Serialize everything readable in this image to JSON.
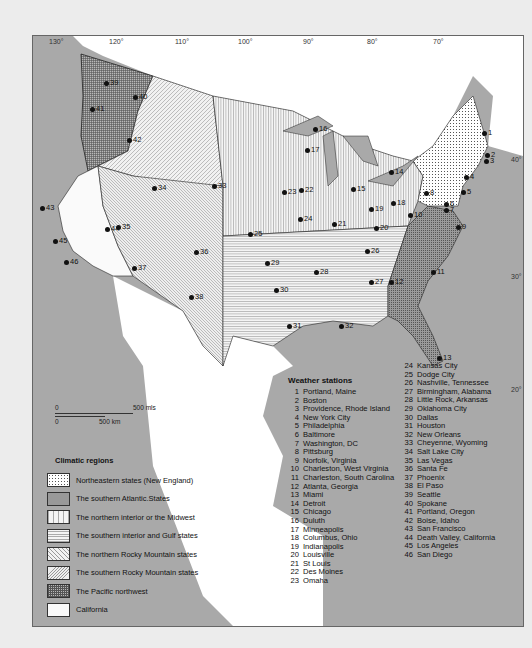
{
  "map": {
    "longitude_labels": [
      "130°",
      "120°",
      "110°",
      "100°",
      "90°",
      "80°",
      "70°"
    ],
    "latitude_labels": [
      "40°",
      "30°",
      "20°"
    ],
    "scale_bar": {
      "miles_start": "0",
      "miles_end": "500 mls",
      "km_start": "0",
      "km_end": "500 km"
    }
  },
  "colors": {
    "ocean": "#a9a9a9",
    "frame_border": "#666666",
    "text": "#111111",
    "outside_land": "#ffffff"
  },
  "stations_heading": "Weather stations",
  "stations": [
    {
      "n": "1",
      "name": "Portland, Maine"
    },
    {
      "n": "2",
      "name": "Boston"
    },
    {
      "n": "3",
      "name": "Providence, Rhode Island"
    },
    {
      "n": "4",
      "name": "New York City"
    },
    {
      "n": "5",
      "name": "Philadelphia"
    },
    {
      "n": "6",
      "name": "Baltimore"
    },
    {
      "n": "7",
      "name": "Washington, DC"
    },
    {
      "n": "8",
      "name": "Pittsburg"
    },
    {
      "n": "9",
      "name": "Norfolk, Virginia"
    },
    {
      "n": "10",
      "name": "Charleston, West Virginia"
    },
    {
      "n": "11",
      "name": "Charleston, South Carolina"
    },
    {
      "n": "12",
      "name": "Atlanta, Georgia"
    },
    {
      "n": "13",
      "name": "Miami"
    },
    {
      "n": "14",
      "name": "Detroit"
    },
    {
      "n": "15",
      "name": "Chicago"
    },
    {
      "n": "16",
      "name": "Duluth"
    },
    {
      "n": "17",
      "name": "Minneapolis"
    },
    {
      "n": "18",
      "name": "Columbus, Ohio"
    },
    {
      "n": "19",
      "name": "Indianapolis"
    },
    {
      "n": "20",
      "name": "Louisville"
    },
    {
      "n": "21",
      "name": "St Louis"
    },
    {
      "n": "22",
      "name": "Des Moines"
    },
    {
      "n": "23",
      "name": "Omaha"
    },
    {
      "n": "24",
      "name": "Kansas City"
    },
    {
      "n": "25",
      "name": "Dodge City"
    },
    {
      "n": "26",
      "name": "Nashville, Tennessee"
    },
    {
      "n": "27",
      "name": "Birmingham, Alabama"
    },
    {
      "n": "28",
      "name": "Little Rock, Arkansas"
    },
    {
      "n": "29",
      "name": "Oklahoma City"
    },
    {
      "n": "30",
      "name": "Dallas"
    },
    {
      "n": "31",
      "name": "Houston"
    },
    {
      "n": "32",
      "name": "New Orleans"
    },
    {
      "n": "33",
      "name": "Cheyenne, Wyoming"
    },
    {
      "n": "34",
      "name": "Salt Lake City"
    },
    {
      "n": "35",
      "name": "Las Vegas"
    },
    {
      "n": "36",
      "name": "Santa Fe"
    },
    {
      "n": "37",
      "name": "Phoenix"
    },
    {
      "n": "38",
      "name": "El Paso"
    },
    {
      "n": "39",
      "name": "Seattle"
    },
    {
      "n": "40",
      "name": "Spokane"
    },
    {
      "n": "41",
      "name": "Portland, Oregon"
    },
    {
      "n": "42",
      "name": "Boise, Idaho"
    },
    {
      "n": "43",
      "name": "San Francisco"
    },
    {
      "n": "44",
      "name": "Death Valley, California"
    },
    {
      "n": "45",
      "name": "Los Angeles"
    },
    {
      "n": "46",
      "name": "San Diego"
    }
  ],
  "legend": {
    "title": "Climatic regions",
    "items": [
      {
        "label": "Northeastern states (New England)",
        "pattern": "dots"
      },
      {
        "label": "The southern Atlantic.States",
        "pattern": "dense-dots"
      },
      {
        "label": "The northern interior or the Midwest",
        "pattern": "vertical-lines"
      },
      {
        "label": "The southern interior and Gulf states",
        "pattern": "horizontal-lines"
      },
      {
        "label": "The northern Rocky Mountain states",
        "pattern": "diagonal-lines"
      },
      {
        "label": "The southern Rocky Mountain states",
        "pattern": "diagonal-lines-dense"
      },
      {
        "label": "The Pacific northwest",
        "pattern": "crosshatch"
      },
      {
        "label": "California",
        "pattern": "blank"
      }
    ]
  },
  "map_markers": [
    {
      "n": "1",
      "x": 448,
      "y": 93
    },
    {
      "n": "2",
      "x": 451,
      "y": 115
    },
    {
      "n": "3",
      "x": 450,
      "y": 121
    },
    {
      "n": "4",
      "x": 430,
      "y": 137
    },
    {
      "n": "5",
      "x": 427,
      "y": 152
    },
    {
      "n": "6",
      "x": 410,
      "y": 164
    },
    {
      "n": "7",
      "x": 410,
      "y": 170
    },
    {
      "n": "8",
      "x": 390,
      "y": 153
    },
    {
      "n": "9",
      "x": 422,
      "y": 187
    },
    {
      "n": "10",
      "x": 374,
      "y": 175
    },
    {
      "n": "11",
      "x": 397,
      "y": 232
    },
    {
      "n": "12",
      "x": 355,
      "y": 242
    },
    {
      "n": "13",
      "x": 403,
      "y": 318
    },
    {
      "n": "14",
      "x": 355,
      "y": 132
    },
    {
      "n": "15",
      "x": 317,
      "y": 149
    },
    {
      "n": "16",
      "x": 279,
      "y": 89
    },
    {
      "n": "17",
      "x": 271,
      "y": 110
    },
    {
      "n": "18",
      "x": 357,
      "y": 163
    },
    {
      "n": "19",
      "x": 335,
      "y": 169
    },
    {
      "n": "20",
      "x": 340,
      "y": 188
    },
    {
      "n": "21",
      "x": 298,
      "y": 184
    },
    {
      "n": "22",
      "x": 265,
      "y": 150
    },
    {
      "n": "23",
      "x": 248,
      "y": 152
    },
    {
      "n": "24",
      "x": 264,
      "y": 179
    },
    {
      "n": "25",
      "x": 214,
      "y": 194
    },
    {
      "n": "26",
      "x": 331,
      "y": 211
    },
    {
      "n": "27",
      "x": 335,
      "y": 242
    },
    {
      "n": "28",
      "x": 280,
      "y": 232
    },
    {
      "n": "29",
      "x": 231,
      "y": 223
    },
    {
      "n": "30",
      "x": 240,
      "y": 250
    },
    {
      "n": "31",
      "x": 253,
      "y": 286
    },
    {
      "n": "32",
      "x": 305,
      "y": 286
    },
    {
      "n": "33",
      "x": 178,
      "y": 146
    },
    {
      "n": "34",
      "x": 118,
      "y": 148
    },
    {
      "n": "35",
      "x": 82,
      "y": 187
    },
    {
      "n": "36",
      "x": 160,
      "y": 212
    },
    {
      "n": "37",
      "x": 98,
      "y": 228
    },
    {
      "n": "38",
      "x": 155,
      "y": 257
    },
    {
      "n": "39",
      "x": 70,
      "y": 43
    },
    {
      "n": "40",
      "x": 99,
      "y": 57
    },
    {
      "n": "41",
      "x": 56,
      "y": 69
    },
    {
      "n": "42",
      "x": 93,
      "y": 100
    },
    {
      "n": "43",
      "x": 6,
      "y": 168
    },
    {
      "n": "44",
      "x": 71,
      "y": 189
    },
    {
      "n": "45",
      "x": 19,
      "y": 201
    },
    {
      "n": "46",
      "x": 30,
      "y": 222
    }
  ]
}
